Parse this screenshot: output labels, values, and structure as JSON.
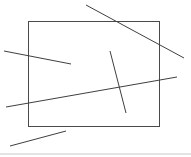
{
  "figure": {
    "title": "Line segments and rectangle figure",
    "width": 191,
    "height": 157,
    "background_color": "#ffffff",
    "stroke_color": "#4a4a4a",
    "baseline_color": "#c9c9c9",
    "stroke_width": 1,
    "shapes": [
      {
        "id": "rectangle",
        "name": "rectangle-outline",
        "type": "rect",
        "x": 28,
        "y": 21,
        "width": 131,
        "height": 105,
        "color": "#4a4a4a",
        "stroke_width": 1
      },
      {
        "id": "line-top-diagonal",
        "name": "line-top-diagonal",
        "type": "line",
        "x1": 86,
        "y1": 5,
        "x2": 184,
        "y2": 58,
        "color": "#3f3f3f",
        "stroke_width": 1
      },
      {
        "id": "line-left-upper",
        "name": "line-left-upper",
        "type": "line",
        "x1": 4,
        "y1": 51,
        "x2": 71,
        "y2": 64,
        "color": "#3f3f3f",
        "stroke_width": 1
      },
      {
        "id": "line-long-shallow",
        "name": "line-long-shallow",
        "type": "line",
        "x1": 6,
        "y1": 107,
        "x2": 177,
        "y2": 77,
        "color": "#3f3f3f",
        "stroke_width": 1
      },
      {
        "id": "line-steep-inner",
        "name": "line-steep-inner",
        "type": "line",
        "x1": 110,
        "y1": 51,
        "x2": 126,
        "y2": 113,
        "color": "#3f3f3f",
        "stroke_width": 1
      },
      {
        "id": "line-bottom-short",
        "name": "line-bottom-short",
        "type": "line",
        "x1": 10,
        "y1": 146,
        "x2": 66,
        "y2": 131,
        "color": "#3f3f3f",
        "stroke_width": 1
      },
      {
        "id": "line-baseline",
        "name": "line-baseline",
        "type": "line",
        "x1": 0,
        "y1": 154,
        "x2": 191,
        "y2": 154,
        "color": "#c9c9c9",
        "stroke_width": 1
      }
    ]
  }
}
